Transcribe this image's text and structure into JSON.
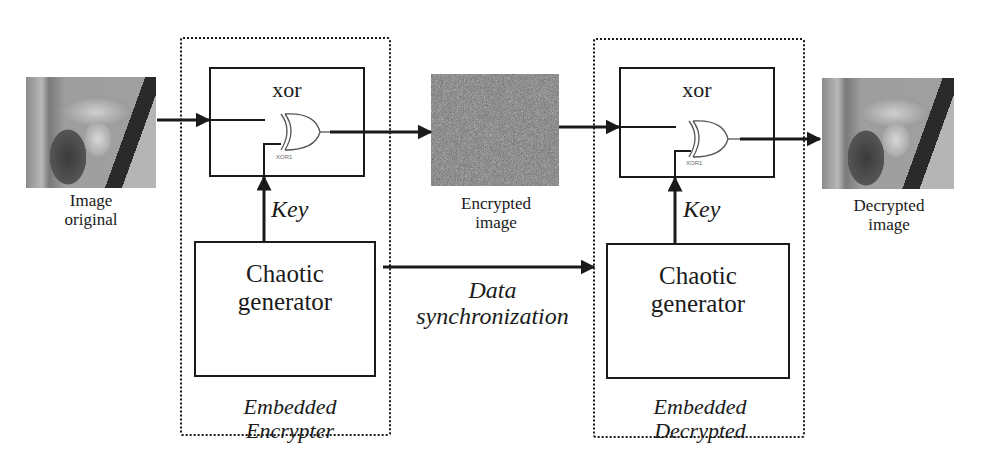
{
  "diagram": {
    "type": "block-diagram",
    "inputs": {
      "original_image": {
        "caption_line1": "Image",
        "caption_line2": "original"
      }
    },
    "encrypter": {
      "xor_block_label": "xor",
      "gate_tag": "XOR1",
      "key_label": "Key",
      "generator_line1": "Chaotic",
      "generator_line2": "generator",
      "group_line1": "Embedded",
      "group_line2": "Encrypter"
    },
    "middle": {
      "encrypted_caption_line1": "Encrypted",
      "encrypted_caption_line2": "image",
      "sync_line1": "Data",
      "sync_line2": "synchronization"
    },
    "decrypter": {
      "xor_block_label": "xor",
      "gate_tag": "XOR1",
      "key_label": "Key",
      "generator_line1": "Chaotic",
      "generator_line2": "generator",
      "group_line1": "Embedded",
      "group_line2": "Decrypted"
    },
    "outputs": {
      "decrypted_image": {
        "caption_line1": "Decrypted",
        "caption_line2": "image"
      }
    },
    "edges": [
      {
        "from": "Image original",
        "to": "xor (encrypter)"
      },
      {
        "from": "Chaotic generator (encrypter)",
        "to": "xor (encrypter)",
        "label": "Key"
      },
      {
        "from": "xor (encrypter)",
        "to": "Encrypted image"
      },
      {
        "from": "Encrypted image",
        "to": "xor (decrypter)"
      },
      {
        "from": "Chaotic generator (encrypter)",
        "to": "Chaotic generator (decrypter)",
        "label": "Data synchronization"
      },
      {
        "from": "Chaotic generator (decrypter)",
        "to": "xor (decrypter)",
        "label": "Key"
      },
      {
        "from": "xor (decrypter)",
        "to": "Decrypted image"
      }
    ],
    "colors": {
      "stroke": "#1a1a1a",
      "background": "#ffffff"
    }
  }
}
